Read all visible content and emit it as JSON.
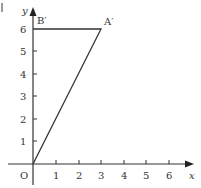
{
  "figure": {
    "origin_label": "O",
    "x_axis_label": "x",
    "y_axis_label": "y",
    "x_ticks": [
      "1",
      "2",
      "3",
      "4",
      "5",
      "6"
    ],
    "y_ticks": [
      "1",
      "2",
      "3",
      "4",
      "5",
      "6"
    ],
    "points": [
      {
        "label": "A′",
        "x": 3,
        "y": 6
      },
      {
        "label": "B′",
        "x": 0,
        "y": 6
      },
      {
        "label": "O",
        "x": 0,
        "y": 0
      }
    ],
    "shape": "triangle O-A′-B′",
    "line_color": "#333333"
  }
}
